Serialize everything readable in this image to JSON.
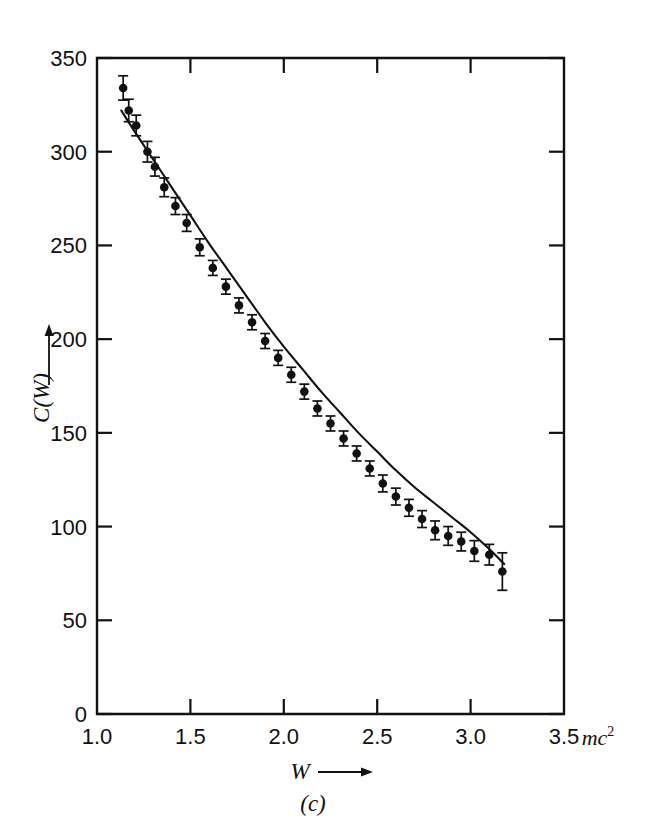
{
  "figure": {
    "panel_caption": "(c)",
    "x_axis": {
      "title": "W",
      "title_arrow": "⟶",
      "unit_label": "mc",
      "unit_exponent": "2",
      "ticks": [
        "1.0",
        "1.5",
        "2.0",
        "2.5",
        "3.0",
        "3.5"
      ],
      "tick_values": [
        1.0,
        1.5,
        2.0,
        2.5,
        3.0,
        3.5
      ],
      "min": 1.0,
      "max": 3.5
    },
    "y_axis": {
      "title": "C(W)",
      "title_arrow": "↑",
      "ticks": [
        "0",
        "50",
        "100",
        "150",
        "200",
        "250",
        "300",
        "350"
      ],
      "tick_values": [
        0,
        50,
        100,
        150,
        200,
        250,
        300,
        350
      ],
      "min": 0,
      "max": 350
    },
    "colors": {
      "ink": "#111111",
      "background": "#ffffff"
    }
  },
  "chart_data": {
    "type": "scatter",
    "title": "",
    "subtitle": "",
    "xlabel": "W",
    "ylabel": "C(W)",
    "xunit": "mc^2",
    "xlim": [
      1.0,
      3.5
    ],
    "ylim": [
      0,
      350
    ],
    "grid": false,
    "legend": null,
    "annotations": [
      "(c)"
    ],
    "series": [
      {
        "name": "measured points",
        "marker": "filled-circle-with-error-bars",
        "x": [
          1.14,
          1.17,
          1.21,
          1.27,
          1.31,
          1.36,
          1.42,
          1.48,
          1.55,
          1.62,
          1.69,
          1.76,
          1.83,
          1.9,
          1.97,
          2.04,
          2.11,
          2.18,
          2.25,
          2.32,
          2.39,
          2.46,
          2.53,
          2.6,
          2.67,
          2.74,
          2.81,
          2.88,
          2.95,
          3.02,
          3.1,
          3.17
        ],
        "y": [
          334,
          322,
          314,
          300,
          292,
          281,
          271,
          262,
          249,
          238,
          228,
          218,
          209,
          199,
          190,
          181,
          172,
          163,
          155,
          147,
          139,
          131,
          123,
          116,
          110,
          104,
          98,
          95,
          92,
          87,
          85,
          76
        ],
        "yerr": [
          6.5,
          6.0,
          5.5,
          5.5,
          5.0,
          5.0,
          4.5,
          4.5,
          4.5,
          4.0,
          4.0,
          4.0,
          4.0,
          4.0,
          4.0,
          4.0,
          4.0,
          4.0,
          4.0,
          4.0,
          4.0,
          4.0,
          4.5,
          4.5,
          4.5,
          4.5,
          5.0,
          5.0,
          5.0,
          5.5,
          5.5,
          10.0
        ]
      },
      {
        "name": "theoretical curve",
        "marker": "none",
        "x": [
          1.13,
          1.2,
          1.3,
          1.4,
          1.5,
          1.6,
          1.7,
          1.8,
          1.9,
          2.0,
          2.1,
          2.2,
          2.3,
          2.4,
          2.5,
          2.6,
          2.7,
          2.8,
          2.9,
          3.0,
          3.1,
          3.18
        ],
        "y": [
          322,
          311,
          296,
          281,
          266,
          251,
          237,
          223,
          209,
          196,
          184,
          172,
          161,
          150,
          140,
          130,
          121,
          113,
          105,
          97,
          88,
          80
        ]
      }
    ]
  }
}
